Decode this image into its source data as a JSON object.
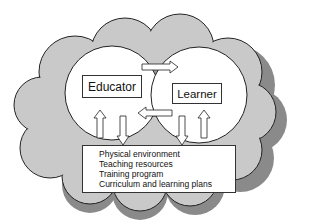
{
  "diagram": {
    "type": "concept-diagram",
    "nodes": {
      "educator": {
        "label": "Educator"
      },
      "learner": {
        "label": "Learner"
      },
      "environment": {
        "items": [
          "Physical environment",
          "Teaching resources",
          "Training program",
          "Curriculum and learning plans"
        ]
      }
    },
    "edges": [
      {
        "from": "educator",
        "to": "learner",
        "kind": "arrow"
      },
      {
        "from": "learner",
        "to": "educator",
        "kind": "arrow"
      },
      {
        "from": "educator",
        "to": "environment",
        "kind": "arrow"
      },
      {
        "from": "environment",
        "to": "educator",
        "kind": "arrow"
      },
      {
        "from": "learner",
        "to": "environment",
        "kind": "arrow"
      },
      {
        "from": "environment",
        "to": "learner",
        "kind": "arrow"
      }
    ],
    "colors": {
      "cloud_fill": "#c9c9c9",
      "cloud_shadow": "#8a8a8a",
      "outline": "#222222",
      "circle_fill": "#ffffff"
    }
  }
}
